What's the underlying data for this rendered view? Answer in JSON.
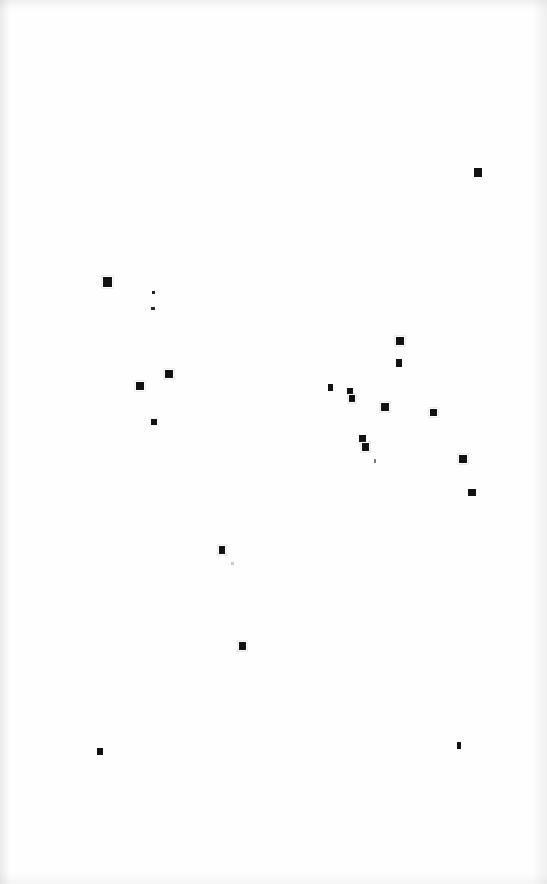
{
  "page": {
    "kind": "scanned-blank-page",
    "width": 547,
    "height": 884,
    "background_color": "#fefefe",
    "ink_color": "#121212",
    "text_content": "",
    "mark_count": 21
  },
  "marks": [
    {
      "id": "speck-01",
      "x": 474,
      "y": 168,
      "w": 8,
      "h": 9,
      "opacity": 1.0,
      "halo": false
    },
    {
      "id": "speck-02",
      "x": 103,
      "y": 277,
      "w": 9,
      "h": 10,
      "opacity": 1.0,
      "halo": true
    },
    {
      "id": "speck-03",
      "x": 152,
      "y": 291,
      "w": 3,
      "h": 3,
      "opacity": 0.95,
      "halo": false
    },
    {
      "id": "speck-04",
      "x": 151,
      "y": 307,
      "w": 4,
      "h": 3,
      "opacity": 0.9,
      "halo": false
    },
    {
      "id": "speck-05",
      "x": 396,
      "y": 337,
      "w": 8,
      "h": 8,
      "opacity": 1.0,
      "halo": true
    },
    {
      "id": "speck-06",
      "x": 396,
      "y": 359,
      "w": 6,
      "h": 8,
      "opacity": 1.0,
      "halo": false
    },
    {
      "id": "speck-07",
      "x": 165,
      "y": 370,
      "w": 8,
      "h": 8,
      "opacity": 1.0,
      "halo": true
    },
    {
      "id": "speck-08",
      "x": 328,
      "y": 384,
      "w": 5,
      "h": 7,
      "opacity": 1.0,
      "halo": false
    },
    {
      "id": "speck-09",
      "x": 347,
      "y": 388,
      "w": 6,
      "h": 6,
      "opacity": 1.0,
      "halo": false
    },
    {
      "id": "speck-10",
      "x": 136,
      "y": 382,
      "w": 8,
      "h": 8,
      "opacity": 1.0,
      "halo": true
    },
    {
      "id": "speck-11",
      "x": 349,
      "y": 395,
      "w": 6,
      "h": 7,
      "opacity": 1.0,
      "halo": true
    },
    {
      "id": "speck-12",
      "x": 381,
      "y": 403,
      "w": 8,
      "h": 8,
      "opacity": 1.0,
      "halo": true
    },
    {
      "id": "speck-13",
      "x": 430,
      "y": 409,
      "w": 7,
      "h": 7,
      "opacity": 1.0,
      "halo": true
    },
    {
      "id": "speck-14",
      "x": 151,
      "y": 419,
      "w": 6,
      "h": 6,
      "opacity": 1.0,
      "halo": false
    },
    {
      "id": "speck-15",
      "x": 359,
      "y": 435,
      "w": 7,
      "h": 7,
      "opacity": 1.0,
      "halo": false
    },
    {
      "id": "speck-16",
      "x": 362,
      "y": 443,
      "w": 7,
      "h": 8,
      "opacity": 1.0,
      "halo": true
    },
    {
      "id": "speck-17",
      "x": 459,
      "y": 455,
      "w": 8,
      "h": 8,
      "opacity": 1.0,
      "halo": true
    },
    {
      "id": "speck-18",
      "x": 374,
      "y": 459,
      "w": 2,
      "h": 4,
      "opacity": 0.55,
      "halo": false
    },
    {
      "id": "speck-19",
      "x": 468,
      "y": 489,
      "w": 8,
      "h": 7,
      "opacity": 1.0,
      "halo": false
    },
    {
      "id": "speck-20",
      "x": 219,
      "y": 546,
      "w": 6,
      "h": 8,
      "opacity": 1.0,
      "halo": true
    },
    {
      "id": "speck-21",
      "x": 231,
      "y": 562,
      "w": 3,
      "h": 3,
      "opacity": 0.22,
      "halo": false
    },
    {
      "id": "speck-22",
      "x": 239,
      "y": 642,
      "w": 7,
      "h": 8,
      "opacity": 1.0,
      "halo": true
    },
    {
      "id": "speck-23",
      "x": 97,
      "y": 748,
      "w": 6,
      "h": 7,
      "opacity": 1.0,
      "halo": false
    },
    {
      "id": "speck-24",
      "x": 457,
      "y": 742,
      "w": 4,
      "h": 7,
      "opacity": 1.0,
      "halo": false
    }
  ]
}
